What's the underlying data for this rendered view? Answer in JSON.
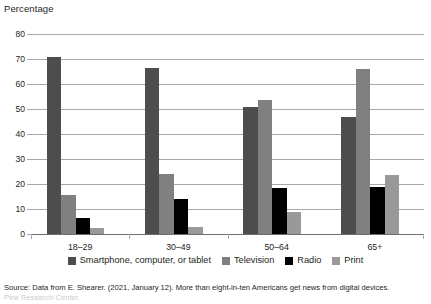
{
  "axis_title": "Percentage",
  "source_note": {
    "line1": "Source: Data from E. Shearer. (2021, January 12). More than eight-in-ten Americans get news from digital devices.",
    "line2": "Pew Research Center."
  },
  "legend": {
    "items": [
      {
        "label": "Smartphone, computer, or tablet",
        "color": "#4d4d4d"
      },
      {
        "label": "Television",
        "color": "#808080"
      },
      {
        "label": "Radio",
        "color": "#000000"
      },
      {
        "label": "Print",
        "color": "#999999"
      }
    ]
  },
  "chart_data": {
    "type": "bar",
    "title": "",
    "xlabel": "",
    "ylabel": "Percentage",
    "ylim": [
      0,
      80
    ],
    "yticks": [
      0,
      10,
      20,
      30,
      40,
      50,
      60,
      70,
      80
    ],
    "ytick_labels": [
      "0",
      "10",
      "20",
      "30",
      "40",
      "50",
      "60",
      "70",
      "80"
    ],
    "grid": true,
    "legend_position": "bottom",
    "categories": [
      "18–29",
      "30–49",
      "50–64",
      "65+"
    ],
    "series": [
      {
        "name": "Smartphone, computer, or tablet",
        "color": "#4d4d4d",
        "values": [
          71,
          66.5,
          51,
          47
        ]
      },
      {
        "name": "Television",
        "color": "#808080",
        "values": [
          15.5,
          24,
          53.5,
          66
        ]
      },
      {
        "name": "Radio",
        "color": "#000000",
        "values": [
          6.5,
          14,
          18.5,
          19
        ]
      },
      {
        "name": "Print",
        "color": "#999999",
        "values": [
          2.5,
          3,
          9,
          23.5
        ]
      }
    ]
  }
}
